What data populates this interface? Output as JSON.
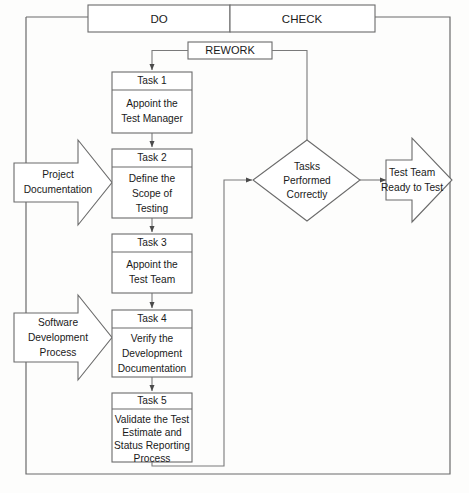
{
  "diagram": {
    "type": "flowchart",
    "colors": {
      "stroke": "#6b6b6b",
      "connector": "#7a7a7a",
      "text": "#1a1a1a",
      "background": "#fdfdfc"
    },
    "header": {
      "cells": [
        {
          "label": "DO"
        },
        {
          "label": "CHECK"
        }
      ]
    },
    "rework": {
      "label": "REWORK"
    },
    "tasks": [
      {
        "id": "task-1",
        "label": "Task 1",
        "lines": [
          "Appoint the",
          "Test Manager"
        ]
      },
      {
        "id": "task-2",
        "label": "Task 2",
        "lines": [
          "Define the",
          "Scope of",
          "Testing"
        ]
      },
      {
        "id": "task-3",
        "label": "Task 3",
        "lines": [
          "Appoint the",
          "Test Team"
        ]
      },
      {
        "id": "task-4",
        "label": "Task 4",
        "lines": [
          "Verify the",
          "Development",
          "Documentation"
        ]
      },
      {
        "id": "task-5",
        "label": "Task 5",
        "lines": [
          "Validate the Test",
          "Estimate and",
          "Status Reporting",
          "Process"
        ]
      }
    ],
    "inputs": [
      {
        "id": "input-project-documentation",
        "lines": [
          "Project",
          "Documentation"
        ]
      },
      {
        "id": "input-software-development-process",
        "lines": [
          "Software",
          "Development",
          "Process"
        ]
      }
    ],
    "decision": {
      "id": "decision-tasks-performed-correctly",
      "lines": [
        "Tasks",
        "Performed",
        "Correctly"
      ]
    },
    "output": {
      "id": "output-test-team-ready",
      "lines": [
        "Test Team",
        "Ready to Test"
      ]
    }
  }
}
